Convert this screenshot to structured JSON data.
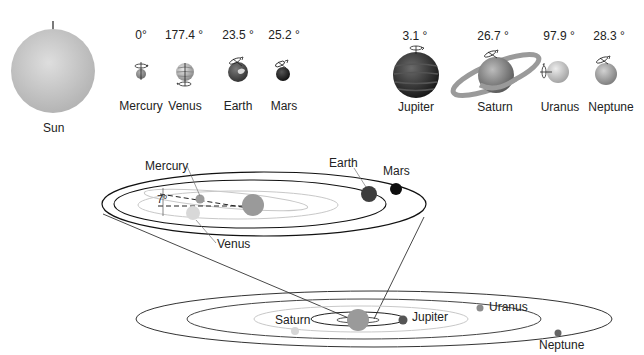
{
  "sun": {
    "label": "Sun",
    "color": "#c8c8c8"
  },
  "planets": [
    {
      "name": "Mercury",
      "tilt": "0°",
      "color": "#9a9a9a"
    },
    {
      "name": "Venus",
      "tilt": "177.4 °",
      "color": "#c9c9c9"
    },
    {
      "name": "Earth",
      "tilt": "23.5 °",
      "color": "#505050"
    },
    {
      "name": "Mars",
      "tilt": "25.2 °",
      "color": "#151515"
    },
    {
      "name": "Jupiter",
      "tilt": "3.1 °",
      "color": "#2e2e2e"
    },
    {
      "name": "Saturn",
      "tilt": "26.7 °",
      "color": "#8a8a8a"
    },
    {
      "name": "Uranus",
      "tilt": "97.9 °",
      "color": "#cfcfcf"
    },
    {
      "name": "Neptune",
      "tilt": "28.3 °",
      "color": "#9c9c9c"
    }
  ],
  "inner_orbits": {
    "labels": {
      "mercury": "Mercury",
      "venus": "Venus",
      "earth": "Earth",
      "mars": "Mars"
    },
    "inclination": "7°"
  },
  "outer_orbits": {
    "labels": {
      "jupiter": "Jupiter",
      "saturn": "Saturn",
      "uranus": "Uranus",
      "neptune": "Neptune"
    }
  }
}
